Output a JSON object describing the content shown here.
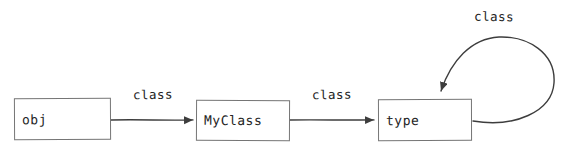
{
  "diagram": {
    "title": "",
    "nodes": [
      {
        "id": "obj",
        "label": "obj"
      },
      {
        "id": "MyClass",
        "label": "MyClass"
      },
      {
        "id": "type",
        "label": "type"
      }
    ],
    "edges": [
      {
        "from": "obj",
        "to": "MyClass",
        "label": "class"
      },
      {
        "from": "MyClass",
        "to": "type",
        "label": "class"
      },
      {
        "from": "type",
        "to": "type",
        "label": "class",
        "shape": "self-loop"
      }
    ],
    "colors": {
      "background": "#ffffff",
      "box_border": "#757575",
      "arrow": "#3d3d3d",
      "text": "#242424"
    }
  }
}
